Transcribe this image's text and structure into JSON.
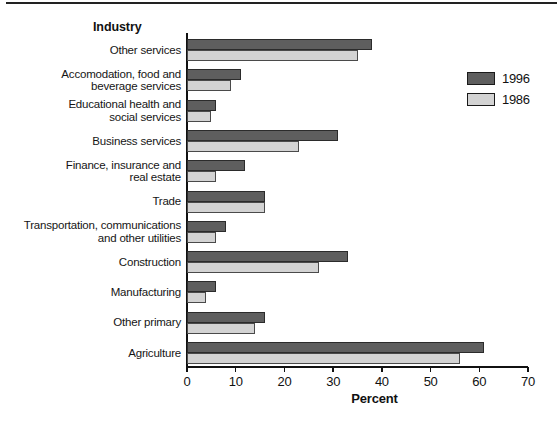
{
  "chart_data": {
    "type": "bar",
    "orientation": "horizontal",
    "ylabel": "Industry",
    "xlabel": "Percent",
    "xlim": [
      0,
      70
    ],
    "xticks": [
      0,
      10,
      20,
      30,
      40,
      50,
      60,
      70
    ],
    "grid": false,
    "legend_position": "right",
    "categories": [
      "Other services",
      "Accomodation, food and\nbeverage services",
      "Educational health and\nsocial services",
      "Business services",
      "Finance, insurance and\nreal estate",
      "Trade",
      "Transportation, communications\nand other utilities",
      "Construction",
      "Manufacturing",
      "Other primary",
      "Agriculture"
    ],
    "series": [
      {
        "name": "1996",
        "color": "#5e5e5e",
        "border_color": "#2b2b2b",
        "values": [
          38,
          11,
          6,
          31,
          12,
          16,
          8,
          33,
          6,
          16,
          61
        ]
      },
      {
        "name": "1986",
        "color": "#d3d3d3",
        "border_color": "#4a4a4a",
        "values": [
          35,
          9,
          5,
          23,
          6,
          16,
          6,
          27,
          4,
          14,
          56
        ]
      }
    ]
  }
}
